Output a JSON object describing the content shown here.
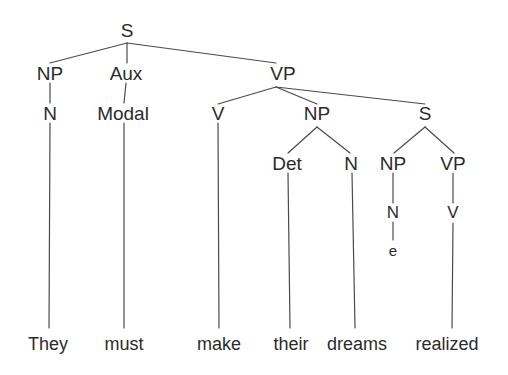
{
  "diagram": {
    "sentence": "They must make their dreams realized",
    "type": "phrase-structure-tree",
    "line_color": "#4a4a4a",
    "text_color": "#2b2b2b",
    "background_color": "#ffffff"
  },
  "nodes": {
    "root_s": "S",
    "np_subject": "NP",
    "aux": "Aux",
    "vp_main": "VP",
    "n_subject": "N",
    "modal": "Modal",
    "v_main": "V",
    "np_object": "NP",
    "s_embedded": "S",
    "det": "Det",
    "n_object": "N",
    "np_embedded": "NP",
    "vp_embedded": "VP",
    "n_empty": "N",
    "v_embedded": "V",
    "empty_element": "e"
  },
  "words": {
    "w1": "They",
    "w2": "must",
    "w3": "make",
    "w4": "their",
    "w5": "dreams",
    "w6": "realized"
  }
}
